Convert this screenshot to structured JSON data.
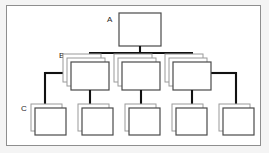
{
  "figure": {
    "type": "hierarchy-diagram",
    "title": "",
    "background_color": "#ffffff",
    "frame_color": "#8e8e8e",
    "stroke_color": "#2b2b2b",
    "box_fill": "#ffffff",
    "box_stroke": "#4a4a4a",
    "shadow_stroke": "#9a9a9a",
    "connector_color": "#111111"
  },
  "levels": [
    {
      "id": "A",
      "label": "A",
      "label_x": 107,
      "label_y": 22,
      "stack_count": 1,
      "nodes": [
        {
          "name": "node-a-1",
          "x": 119,
          "y": 13,
          "w": 42,
          "h": 33
        }
      ]
    },
    {
      "id": "B",
      "label": "B",
      "label_x": 59,
      "label_y": 58,
      "stack_count": 3,
      "nodes": [
        {
          "name": "node-b-1",
          "x": 71,
          "y": 62,
          "w": 38,
          "h": 28
        },
        {
          "name": "node-b-2",
          "x": 122,
          "y": 62,
          "w": 38,
          "h": 28
        },
        {
          "name": "node-b-3",
          "x": 173,
          "y": 62,
          "w": 38,
          "h": 28
        }
      ]
    },
    {
      "id": "C",
      "label": "C",
      "label_x": 21,
      "label_y": 111,
      "stack_count": 2,
      "nodes": [
        {
          "name": "node-c-1",
          "x": 31,
          "y": 108,
          "w": 31,
          "h": 27
        },
        {
          "name": "node-c-2",
          "x": 78,
          "y": 108,
          "w": 31,
          "h": 27
        },
        {
          "name": "node-c-3",
          "x": 125,
          "y": 108,
          "w": 31,
          "h": 27
        },
        {
          "name": "node-c-4",
          "x": 172,
          "y": 108,
          "w": 31,
          "h": 27
        },
        {
          "name": "node-c-5",
          "x": 219,
          "y": 108,
          "w": 31,
          "h": 27
        }
      ]
    }
  ],
  "connectors": {
    "a_bus": {
      "name": "bus-a-to-b",
      "trunk_x": 140,
      "trunk_top": 46,
      "bus_y": 53,
      "bus_left": 90,
      "bus_right": 192,
      "drops": [
        90,
        140,
        192
      ],
      "drop_end": 66
    },
    "b_to_c": [
      {
        "name": "arrow-b1-to-c2",
        "x": 90,
        "y_start": 90,
        "y_end": 113
      },
      {
        "name": "arrow-b2-to-c3",
        "x": 141,
        "y_start": 90,
        "y_end": 113
      },
      {
        "name": "arrow-b3-to-c4",
        "x": 192,
        "y_start": 90,
        "y_end": 113
      }
    ],
    "side_branches": [
      {
        "name": "arrow-b1-to-c1",
        "from_x": 71,
        "elbow_x": 44,
        "elbow_y": 76,
        "y_end": 113
      },
      {
        "name": "arrow-b3-to-c5",
        "from_x": 211,
        "elbow_x": 236,
        "elbow_y": 76,
        "y_end": 113
      }
    ]
  },
  "legend": {
    "a_meaning": "A",
    "b_meaning": "B",
    "c_meaning": "C"
  }
}
